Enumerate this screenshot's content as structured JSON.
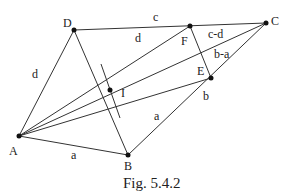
{
  "figure": {
    "caption": "Fig. 5.4.2",
    "points": {
      "A": {
        "label": "A",
        "x": 19,
        "y": 136
      },
      "B": {
        "label": "B",
        "x": 128,
        "y": 155
      },
      "C": {
        "label": "C",
        "x": 266,
        "y": 23
      },
      "D": {
        "label": "D",
        "x": 74,
        "y": 30
      },
      "E": {
        "label": "E",
        "x": 211,
        "y": 78
      },
      "F": {
        "label": "F",
        "x": 190,
        "y": 26
      },
      "I": {
        "label": "I",
        "x": 110,
        "y": 90
      }
    },
    "segment_labels": {
      "DC": "c",
      "DF": "d",
      "FC": "c-d",
      "EC": "b-a",
      "BE": "b",
      "AD": "d",
      "AB": "a",
      "IE": "a"
    }
  }
}
